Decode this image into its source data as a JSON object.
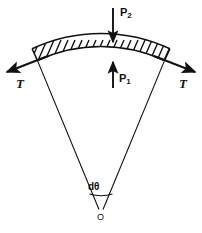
{
  "figure": {
    "type": "mechanics-free-body-diagram",
    "background_color": "#ffffff",
    "stroke_color": "#111111",
    "labels": {
      "pressure_outer": "P",
      "pressure_outer_sub": "2",
      "pressure_inner": "P",
      "pressure_inner_sub": "1",
      "tension_left": "T",
      "tension_right": "T",
      "angle": "dθ",
      "origin": "O"
    },
    "arrows": {
      "p2_direction": "down",
      "p1_direction": "up",
      "tension_left_direction": "left-outward-tangent",
      "tension_right_direction": "right-outward-tangent"
    },
    "geometry": {
      "center_x": 101,
      "center_y": 211,
      "arc_inner_radius": 150,
      "arc_outer_radius": 163,
      "half_angle_deg": 23,
      "hatch_count": 19
    }
  }
}
